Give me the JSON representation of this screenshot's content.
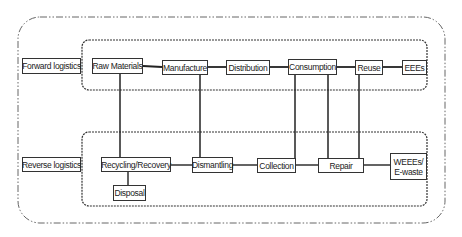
{
  "diagram": {
    "type": "flow",
    "colors": {
      "line": "#222222",
      "border": "#333333",
      "background": "#ffffff"
    },
    "groups": [
      {
        "id": "forward",
        "label": "Forward logistics"
      },
      {
        "id": "reverse",
        "label": "Reverse logistics"
      }
    ],
    "forward_nodes": [
      {
        "id": "raw",
        "label": "Raw Materials"
      },
      {
        "id": "manufacture",
        "label": "Manufacture"
      },
      {
        "id": "distribution",
        "label": "Distribution"
      },
      {
        "id": "consumption",
        "label": "Consumption"
      },
      {
        "id": "reuse",
        "label": "Reuse"
      },
      {
        "id": "eees",
        "label": "EEEs"
      }
    ],
    "reverse_nodes": [
      {
        "id": "recycling",
        "label": "Recycling/Recovery"
      },
      {
        "id": "dismantling",
        "label": "Dismantling"
      },
      {
        "id": "collection",
        "label": "Collection"
      },
      {
        "id": "repair",
        "label": "Repair"
      },
      {
        "id": "weees",
        "label_line1": "WEEEs/",
        "label_line2": "E-waste"
      },
      {
        "id": "disposal",
        "label": "Disposal"
      }
    ],
    "edges": [
      [
        "raw",
        "manufacture"
      ],
      [
        "manufacture",
        "distribution"
      ],
      [
        "distribution",
        "consumption"
      ],
      [
        "consumption",
        "reuse"
      ],
      [
        "reuse",
        "eees"
      ],
      [
        "recycling",
        "dismantling"
      ],
      [
        "dismantling",
        "collection"
      ],
      [
        "collection",
        "repair"
      ],
      [
        "repair",
        "weees"
      ],
      [
        "recycling",
        "disposal"
      ],
      [
        "raw",
        "recycling"
      ],
      [
        "manufacture",
        "dismantling"
      ],
      [
        "consumption",
        "collection"
      ],
      [
        "consumption",
        "repair"
      ],
      [
        "reuse",
        "repair"
      ]
    ]
  }
}
